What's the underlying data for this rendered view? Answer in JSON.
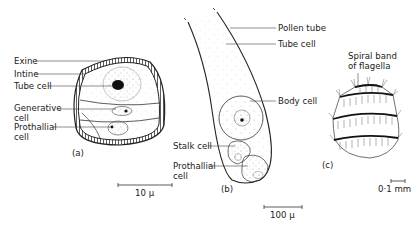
{
  "figure_a": {
    "labels": {
      "exine": "Exine",
      "intine": "Intine",
      "tube_cell": "Tube cell",
      "generative_cell_1": "Generative",
      "generative_cell_2": "cell",
      "prothallial_cell_1": "Prothallial",
      "prothallial_cell_2": "cell"
    },
    "caption": "(a)",
    "scale_bar": "10 μ"
  },
  "figure_b": {
    "labels": {
      "pollen_tube": "Pollen tube",
      "tube_cell": "Tube cell",
      "body_cell": "Body cell",
      "stalk_cell": "Stalk cell",
      "prothallial_cell_1": "Prothallial",
      "prothallial_cell_2": "cell"
    },
    "caption": "(b)",
    "scale_bar": "100 μ"
  },
  "figure_c": {
    "labels": {
      "spiral_band_1": "Spiral band",
      "spiral_band_2": "of flagella"
    },
    "caption": "(c)",
    "scale_bar": "0·1 mm"
  }
}
